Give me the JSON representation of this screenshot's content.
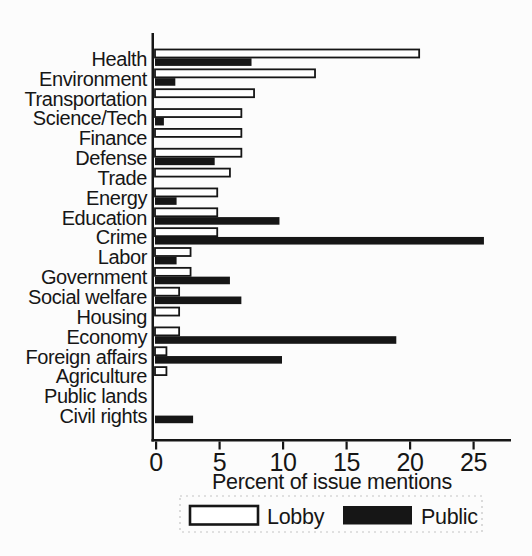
{
  "chart_data": {
    "type": "bar",
    "orientation": "horizontal",
    "title": "",
    "xlabel": "Percent of issue mentions",
    "ylabel": "",
    "xlim": [
      0,
      28
    ],
    "xticks": [
      0,
      5,
      10,
      15,
      20,
      25
    ],
    "xtick_labels": [
      "0",
      "5",
      "10",
      "15",
      "20",
      "25"
    ],
    "grid": false,
    "legend_position": "bottom",
    "categories": [
      "Health",
      "Environment",
      "Transportation",
      "Science/Tech",
      "Finance",
      "Defense",
      "Trade",
      "Energy",
      "Education",
      "Crime",
      "Labor",
      "Government",
      "Social welfare",
      "Housing",
      "Economy",
      "Foreign affairs",
      "Agriculture",
      "Public lands",
      "Civil rights"
    ],
    "series": [
      {
        "name": "Lobby",
        "fill": "#ffffff",
        "stroke": "#161616",
        "values": [
          20.8,
          12.6,
          7.8,
          6.8,
          6.8,
          6.8,
          5.9,
          4.9,
          4.9,
          4.9,
          2.8,
          2.8,
          1.9,
          1.9,
          1.9,
          0.9,
          0.9,
          0,
          0
        ]
      },
      {
        "name": "Public",
        "fill": "#161616",
        "stroke": "#161616",
        "values": [
          7.6,
          1.6,
          0,
          0.7,
          0,
          4.7,
          0,
          1.7,
          9.8,
          25.9,
          1.7,
          5.9,
          6.8,
          0,
          19.0,
          10.0,
          0,
          0,
          3.0
        ]
      }
    ]
  },
  "colors": {
    "ink": "#161616",
    "paper": "#fcfcfc",
    "legend_border": "#c4c4c4"
  }
}
